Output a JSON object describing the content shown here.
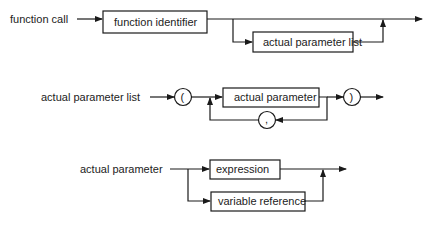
{
  "diagrams": [
    {
      "name": "function call",
      "label": "function call",
      "elements": [
        {
          "kind": "nonterminal",
          "text": "function identifier"
        },
        {
          "kind": "nonterminal",
          "text": "actual parameter list",
          "optional": true
        }
      ]
    },
    {
      "name": "actual parameter list",
      "label": "actual parameter list",
      "elements": [
        {
          "kind": "terminal",
          "text": "("
        },
        {
          "kind": "nonterminal",
          "text": "actual parameter",
          "repeat_separator": ","
        },
        {
          "kind": "terminal",
          "text": ","
        },
        {
          "kind": "terminal",
          "text": ")"
        }
      ]
    },
    {
      "name": "actual parameter",
      "label": "actual parameter",
      "elements": [
        {
          "kind": "nonterminal",
          "text": "expression",
          "alternative": 1
        },
        {
          "kind": "nonterminal",
          "text": "variable reference",
          "alternative": 2
        }
      ]
    }
  ]
}
